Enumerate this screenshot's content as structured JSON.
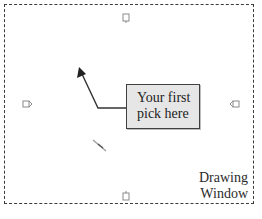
{
  "diagram": {
    "title": "Drawing Window",
    "label_lines": [
      "Drawing",
      "Window"
    ],
    "callout": {
      "lines": [
        "Your first",
        "pick here"
      ],
      "fill": "#e6e6e6",
      "border": "#404040"
    },
    "grips": [
      {
        "position": "top-center",
        "icon": "grip-handle-top-icon"
      },
      {
        "position": "left-middle",
        "icon": "grip-handle-left-icon"
      },
      {
        "position": "right-middle",
        "icon": "grip-handle-right-icon"
      },
      {
        "position": "bottom-center",
        "icon": "grip-handle-bottom-icon"
      }
    ],
    "pointer": {
      "icon": "pick-arrow-icon",
      "color": "#333333"
    },
    "cursor_mark": {
      "icon": "crosshair-stroke-icon"
    },
    "border_style": "dashed"
  }
}
